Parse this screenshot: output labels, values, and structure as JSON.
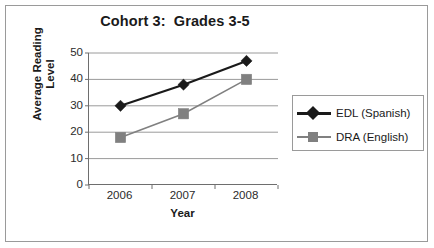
{
  "chart_data": {
    "type": "line",
    "title": "Cohort 3:  Grades 3-5",
    "xlabel": "Year",
    "ylabel_line1": "Average Reading",
    "ylabel_line2": "Level",
    "categories": [
      "2006",
      "2007",
      "2008"
    ],
    "ylim": [
      0,
      50
    ],
    "yticks": [
      "0",
      "10",
      "20",
      "30",
      "40",
      "50"
    ],
    "ytick_values": [
      0,
      10,
      20,
      30,
      40,
      50
    ],
    "grid": "horizontal",
    "legend_position": "right",
    "series": [
      {
        "name": "EDL (Spanish)",
        "values": [
          30,
          38,
          47
        ],
        "color": "#1a1a1a",
        "marker": "diamond"
      },
      {
        "name": "DRA (English)",
        "values": [
          18,
          27,
          40
        ],
        "color": "#808080",
        "marker": "square"
      }
    ]
  },
  "colors": {
    "series_edl": "#1a1a1a",
    "series_dra": "#808080",
    "gridline": "#9a9a9a",
    "axis": "#6e6e6e",
    "frame": "#9a9a9a",
    "text": "#1a1a1a",
    "background": "#ffffff"
  }
}
